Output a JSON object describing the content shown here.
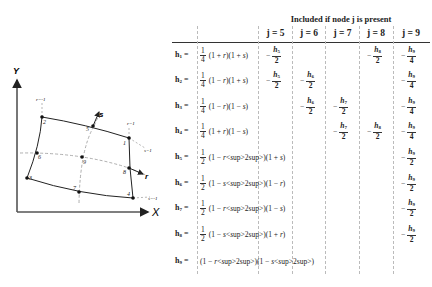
{
  "table": {
    "title": "Included if node j is present",
    "column_headers": [
      "j = 5",
      "j = 6",
      "j = 7",
      "j = 8",
      "j = 9"
    ],
    "rows": [
      {
        "label": "h1 =",
        "coef": {
          "num": "1",
          "den": "4"
        },
        "expr": "(1 + r)(1 + s)",
        "cells": [
          "−h5/2",
          "",
          "",
          "−h8/2",
          "−h9/4"
        ]
      },
      {
        "label": "h2 =",
        "coef": {
          "num": "1",
          "den": "4"
        },
        "expr": "(1 − r)(1 + s)",
        "cells": [
          "−h5/2",
          "−h6/2",
          "",
          "",
          "−h9/4"
        ]
      },
      {
        "label": "h3 =",
        "coef": {
          "num": "1",
          "den": "4"
        },
        "expr": "(1 − r)(1 − s)",
        "cells": [
          "",
          "−h6/2",
          "−h7/2",
          "",
          "−h9/4"
        ]
      },
      {
        "label": "h4 =",
        "coef": {
          "num": "1",
          "den": "4"
        },
        "expr": "(1 + r)(1 − s)",
        "cells": [
          "",
          "",
          "−h7/2",
          "−h8/2",
          "−h9/4"
        ]
      },
      {
        "label": "h5 =",
        "coef": {
          "num": "1",
          "den": "2"
        },
        "expr": "(1 − r²)(1 + s)",
        "cells": [
          "",
          "",
          "",
          "",
          "−h9/2"
        ]
      },
      {
        "label": "h6 =",
        "coef": {
          "num": "1",
          "den": "2"
        },
        "expr": "(1 − s²)(1 − r)",
        "cells": [
          "",
          "",
          "",
          "",
          "−h9/2"
        ]
      },
      {
        "label": "h7 =",
        "coef": {
          "num": "1",
          "den": "2"
        },
        "expr": "(1 − r²)(1 − s)",
        "cells": [
          "",
          "",
          "",
          "",
          "−h9/2"
        ]
      },
      {
        "label": "h8 =",
        "coef": {
          "num": "1",
          "den": "2"
        },
        "expr": "(1 − s²)(1 + r)",
        "cells": [
          "",
          "",
          "",
          "",
          "−h9/2"
        ]
      },
      {
        "label": "h9 =",
        "coef": null,
        "expr": "(1 − r²)(1 − s²)",
        "cells": [
          "",
          "",
          "",
          "",
          ""
        ]
      }
    ]
  },
  "diagram": {
    "axis_x_label": "X",
    "axis_y_label": "Y",
    "local_axis_r_label": "r",
    "local_axis_s_label": "s",
    "line_labels": {
      "r_pos": "r=1",
      "r_neg": "r=-1",
      "s_pos": "s=1",
      "s_neg": "s=-1"
    },
    "nodes": [
      "1",
      "2",
      "3",
      "4",
      "5",
      "6",
      "7",
      "8",
      "9"
    ]
  }
}
